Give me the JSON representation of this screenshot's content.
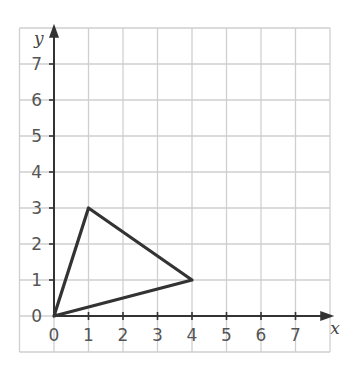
{
  "diagram": {
    "type": "coordinate-grid-triangle",
    "x_axis": {
      "label": "x",
      "ticks": [
        "0",
        "1",
        "2",
        "3",
        "4",
        "5",
        "6",
        "7"
      ],
      "range": [
        -1,
        8
      ]
    },
    "y_axis": {
      "label": "y",
      "ticks": [
        "0",
        "1",
        "2",
        "3",
        "4",
        "5",
        "6",
        "7"
      ],
      "range": [
        -1,
        8
      ]
    },
    "triangle": {
      "vertices": [
        [
          0,
          0
        ],
        [
          1,
          3
        ],
        [
          4,
          1
        ]
      ]
    },
    "colors": {
      "grid": "#cfcfcf",
      "axis": "#333333",
      "shape": "#333333"
    }
  }
}
